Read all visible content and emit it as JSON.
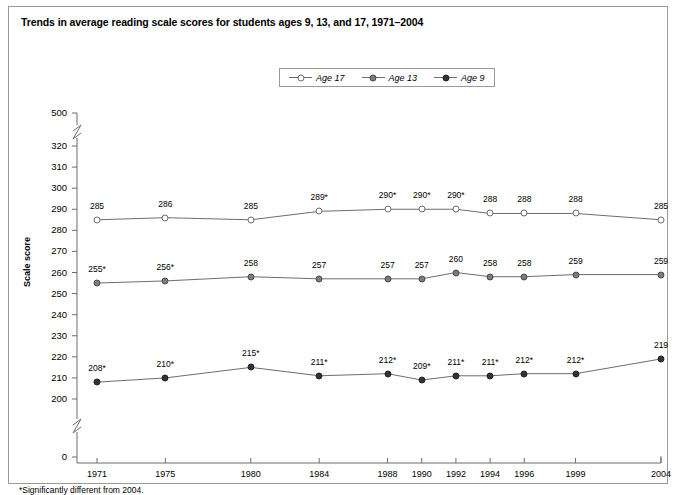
{
  "figure": {
    "title": "Trends in average reading scale scores for students ages 9, 13, and 17, 1971–2004",
    "footnote": "*Significantly different from 2004."
  },
  "colors": {
    "age17_marker_fill": "#ffffff",
    "age17_marker_stroke": "#6d6d6d",
    "age13_marker_fill": "#7c7c7c",
    "age9_marker_fill": "#333333",
    "line": "#6d6d6d",
    "axis": "#6d6d6d",
    "border": "#9a9a9a",
    "text": "#000000"
  },
  "legend": {
    "entries": [
      {
        "label": "Age 17",
        "marker": "open-circle-marker"
      },
      {
        "label": "Age 13",
        "marker": "gray-circle-marker"
      },
      {
        "label": "Age 9",
        "marker": "dark-circle-marker"
      }
    ]
  },
  "chart_data": {
    "type": "line",
    "title": "Trends in average reading scale scores for students ages 9, 13, and 17, 1971–2004",
    "xlabel": "",
    "ylabel": "Scale score",
    "grid": false,
    "legend_position": "top-center",
    "x": [
      1971,
      1975,
      1980,
      1984,
      1988,
      1990,
      1992,
      1994,
      1996,
      1999,
      2004
    ],
    "categories": [
      "1971",
      "1975",
      "1980",
      "1984",
      "1988",
      "1990",
      "1992",
      "1994",
      "1996",
      "1999",
      "2004"
    ],
    "ylim": [
      200,
      320
    ],
    "yticks": [
      500,
      320,
      310,
      300,
      290,
      280,
      270,
      260,
      250,
      240,
      230,
      220,
      210,
      200,
      0
    ],
    "axis_breaks": [
      "between 500 and 320",
      "between 200 and 0"
    ],
    "annotation": "* marks values significantly different from 2004.",
    "series": [
      {
        "name": "Age 17",
        "values": [
          285,
          286,
          285,
          289,
          290,
          290,
          290,
          288,
          288,
          288,
          285
        ],
        "labels": [
          "285",
          "286",
          "285",
          "289*",
          "290*",
          "290*",
          "290*",
          "288",
          "288",
          "288",
          "285"
        ],
        "significant": [
          false,
          false,
          false,
          true,
          true,
          true,
          true,
          false,
          false,
          false,
          false
        ]
      },
      {
        "name": "Age 13",
        "values": [
          255,
          256,
          258,
          257,
          257,
          257,
          260,
          258,
          258,
          259,
          259
        ],
        "labels": [
          "255*",
          "256*",
          "258",
          "257",
          "257",
          "257",
          "260",
          "258",
          "258",
          "259",
          "259"
        ],
        "significant": [
          true,
          true,
          false,
          false,
          false,
          false,
          false,
          false,
          false,
          false,
          false
        ]
      },
      {
        "name": "Age 9",
        "values": [
          208,
          210,
          215,
          211,
          212,
          209,
          211,
          211,
          212,
          212,
          219
        ],
        "labels": [
          "208*",
          "210*",
          "215*",
          "211*",
          "212*",
          "209*",
          "211*",
          "211*",
          "212*",
          "212*",
          "219"
        ],
        "significant": [
          true,
          true,
          true,
          true,
          true,
          true,
          true,
          true,
          true,
          true,
          false
        ]
      }
    ]
  }
}
